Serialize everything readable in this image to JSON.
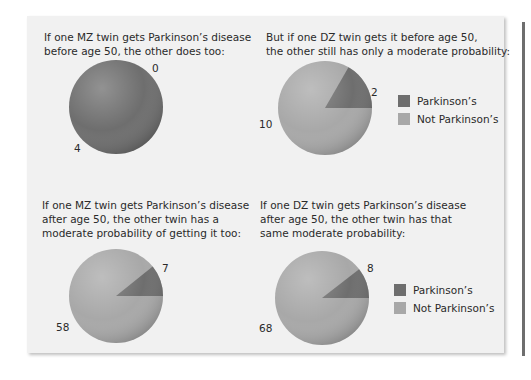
{
  "colors": {
    "parkinsons": "#6e6e6e",
    "not_parkinsons": "#a8a8a8",
    "panel_bg": "#f1f1f1"
  },
  "legend": {
    "items": [
      {
        "label": "Parkinson’s",
        "color": "#6e6e6e"
      },
      {
        "label": "Not Parkinson’s",
        "color": "#a8a8a8"
      }
    ]
  },
  "panels": [
    {
      "caption_lines": [
        "If one MZ twin gets Parkinson’s disease",
        "before age 50, the other does too:"
      ],
      "parkinsons": 4,
      "not_parkinsons": 0,
      "label_parkinsons": "4",
      "label_not": "0"
    },
    {
      "caption_lines": [
        "But if one DZ twin gets it before age 50,",
        "the other still has only a moderate probability:"
      ],
      "parkinsons": 2,
      "not_parkinsons": 10,
      "label_parkinsons": "2",
      "label_not": "10"
    },
    {
      "caption_lines": [
        "If one MZ twin gets Parkinson’s disease",
        "after age 50, the other twin has a",
        "moderate probability of getting it too:"
      ],
      "parkinsons": 7,
      "not_parkinsons": 58,
      "label_parkinsons": "7",
      "label_not": "58"
    },
    {
      "caption_lines": [
        "If one DZ twin gets Parkinson’s disease",
        "after age 50, the other twin has that",
        "same moderate probability:"
      ],
      "parkinsons": 8,
      "not_parkinsons": 68,
      "label_parkinsons": "8",
      "label_not": "68"
    }
  ],
  "chart_data": [
    {
      "type": "pie",
      "title": "If one MZ twin gets Parkinson’s disease before age 50, the other does too:",
      "categories": [
        "Parkinson’s",
        "Not Parkinson’s"
      ],
      "values": [
        4,
        0
      ]
    },
    {
      "type": "pie",
      "title": "But if one DZ twin gets it before age 50, the other still has only a moderate probability:",
      "categories": [
        "Parkinson’s",
        "Not Parkinson’s"
      ],
      "values": [
        2,
        10
      ],
      "legend_position": "right"
    },
    {
      "type": "pie",
      "title": "If one MZ twin gets Parkinson’s disease after age 50, the other twin has a moderate probability of getting it too:",
      "categories": [
        "Parkinson’s",
        "Not Parkinson’s"
      ],
      "values": [
        7,
        58
      ]
    },
    {
      "type": "pie",
      "title": "If one DZ twin gets Parkinson’s disease after age 50, the other twin has that same moderate probability:",
      "categories": [
        "Parkinson’s",
        "Not Parkinson’s"
      ],
      "values": [
        8,
        68
      ],
      "legend_position": "right"
    }
  ]
}
